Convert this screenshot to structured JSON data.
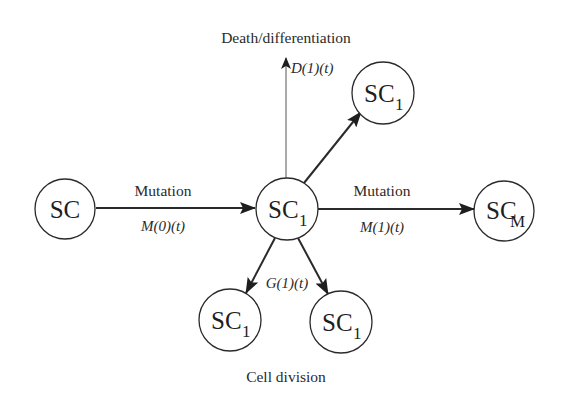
{
  "diagram": {
    "colors": {
      "stroke": "#2a2a2a",
      "text": "#1e1e1e",
      "background": "#ffffff"
    },
    "nodes": {
      "sc": {
        "base": "SC",
        "sub": ""
      },
      "center": {
        "base": "SC",
        "sub": "1"
      },
      "top_right": {
        "base": "SC",
        "sub": "1"
      },
      "sc_m": {
        "base": "SC",
        "sub": "M"
      },
      "bottom_left": {
        "base": "SC",
        "sub": "1"
      },
      "bottom_right": {
        "base": "SC",
        "sub": "1"
      }
    },
    "labels": {
      "death": "Death/differentiation",
      "division": "Cell division",
      "mutation_left": "Mutation",
      "mutation_right": "Mutation"
    },
    "rates": {
      "m0": "M(0)(t)",
      "m1": "M(1)(t)",
      "d1": "D(1)(t)",
      "g1": "G(1)(t)"
    },
    "edges": [
      {
        "from": "SC",
        "to": "SC1",
        "label": "Mutation",
        "rate": "M(0)(t)"
      },
      {
        "from": "SC1",
        "to": "SCM",
        "label": "Mutation",
        "rate": "M(1)(t)"
      },
      {
        "from": "SC1",
        "to": "Death/differentiation",
        "rate": "D(1)(t)"
      },
      {
        "from": "SC1",
        "to": "SC1 (top right)",
        "rate": ""
      },
      {
        "from": "SC1",
        "to": "SC1 + SC1",
        "label": "Cell division",
        "rate": "G(1)(t)"
      }
    ]
  }
}
